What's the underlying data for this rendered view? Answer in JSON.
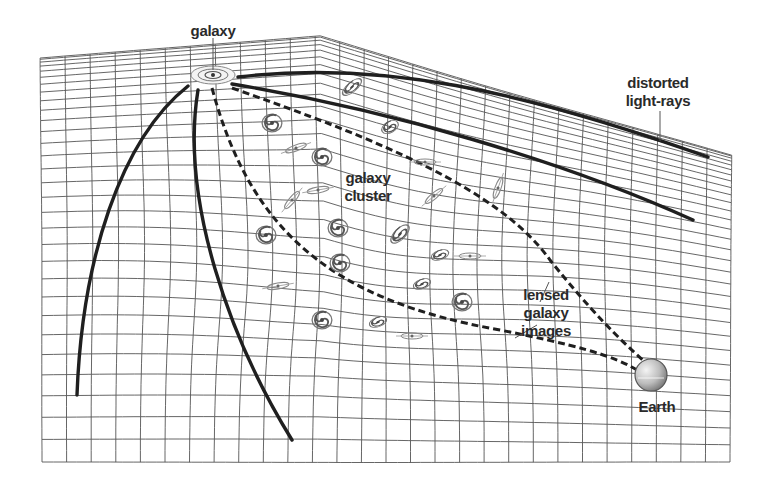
{
  "diagram": {
    "type": "gravitational-lensing-illustration",
    "labels": {
      "source_galaxy": "galaxy",
      "distorted_rays_line1": "distorted",
      "distorted_rays_line2": "light-rays",
      "cluster_line1": "galaxy",
      "cluster_line2": "cluster",
      "lensed_line1": "lensed",
      "lensed_line2": "galaxy",
      "lensed_line3": "images",
      "observer": "Earth"
    },
    "elements": {
      "spacetime_grid": "warped-grid",
      "source": "spiral-galaxy-icon",
      "cluster_members": "spiral-galaxy-icon",
      "observer": "earth-sphere-icon",
      "solid_rays": 4,
      "dashed_rays": 2
    },
    "colors": {
      "background": "#ffffff",
      "grid": "#555555",
      "rays": "#1f1f1f",
      "text": "#2a2a2a",
      "earth_light": "#f2f2f2",
      "earth_dark": "#8a8a8a"
    }
  }
}
